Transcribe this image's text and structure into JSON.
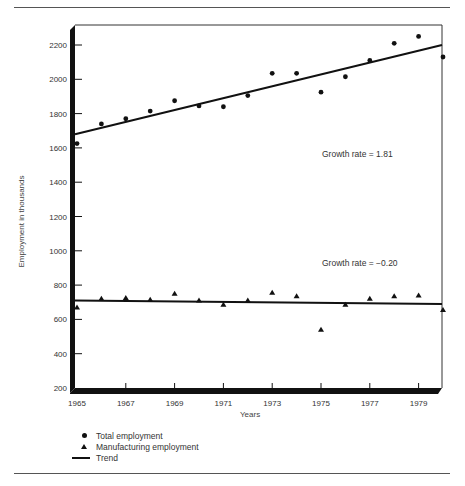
{
  "chart_data": {
    "type": "scatter",
    "title": "",
    "xlabel": "Years",
    "ylabel": "Employment in thousands",
    "ylim": [
      200,
      2300
    ],
    "xlim": [
      1965,
      1980
    ],
    "x_ticks": [
      "1965",
      "1967",
      "1969",
      "1971",
      "1973",
      "1975",
      "1977",
      "1979"
    ],
    "y_ticks": [
      "200",
      "400",
      "600",
      "800",
      "1000",
      "1200",
      "1400",
      "1600",
      "1800",
      "2000",
      "2200"
    ],
    "grid": false,
    "legend_position": "bottom-left",
    "x": [
      1965,
      1966,
      1967,
      1968,
      1969,
      1970,
      1971,
      1972,
      1973,
      1974,
      1975,
      1976,
      1977,
      1978,
      1979,
      1980
    ],
    "series": [
      {
        "name": "Total employment",
        "marker": "circle",
        "values": [
          1625,
          1740,
          1770,
          1815,
          1875,
          1845,
          1840,
          1905,
          2035,
          2035,
          1925,
          2015,
          2110,
          2210,
          2250,
          2130
        ],
        "trend": {
          "start": 1680,
          "end": 2200
        },
        "annotation": "Growth rate = 1.81"
      },
      {
        "name": "Manufacturing employment",
        "marker": "triangle",
        "values": [
          670,
          720,
          725,
          715,
          750,
          710,
          685,
          710,
          755,
          735,
          540,
          685,
          720,
          735,
          740,
          655
        ],
        "trend": {
          "start": 710,
          "end": 690
        },
        "annotation": "Growth rate = −0.20"
      }
    ]
  },
  "legend": {
    "items": [
      {
        "symbol": "circle",
        "label": "Total employment"
      },
      {
        "symbol": "triangle",
        "label": "Manufacturing employment"
      },
      {
        "symbol": "line",
        "label": "Trend"
      }
    ]
  },
  "colors": {
    "ink": "#111111",
    "text": "#333333",
    "background": "#ffffff"
  }
}
